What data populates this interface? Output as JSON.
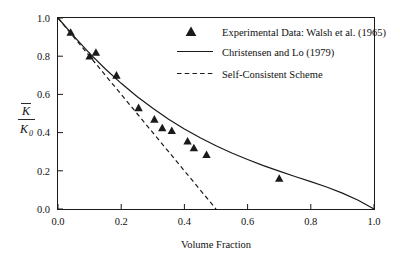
{
  "chart_data": {
    "type": "scatter",
    "title": "",
    "xlabel": "Volume Fraction",
    "ylabel_numerator": "K",
    "ylabel_denominator": "K",
    "ylabel_denominator_subscript": "0",
    "ylabel_has_overbar": true,
    "xlim": [
      0.0,
      1.0
    ],
    "ylim": [
      0.0,
      1.0
    ],
    "grid": false,
    "legend_position": "top-right",
    "x_ticks": [
      "0.0",
      "0.2",
      "0.4",
      "0.6",
      "0.8",
      "1.0"
    ],
    "x_tick_values": [
      0.0,
      0.2,
      0.4,
      0.6,
      0.8,
      1.0
    ],
    "y_ticks": [
      "0.0",
      "0.2",
      "0.4",
      "0.6",
      "0.8",
      "1.0"
    ],
    "y_tick_values": [
      0.0,
      0.2,
      0.4,
      0.6,
      0.8,
      1.0
    ],
    "series": [
      {
        "name": "Experimental Data: Walsh et al. (1965)",
        "type": "scatter",
        "marker": "triangle-up",
        "color": "#1a1a1a",
        "points": [
          [
            0.04,
            0.925
          ],
          [
            0.1,
            0.8
          ],
          [
            0.12,
            0.82
          ],
          [
            0.185,
            0.7
          ],
          [
            0.255,
            0.53
          ],
          [
            0.305,
            0.47
          ],
          [
            0.33,
            0.425
          ],
          [
            0.36,
            0.41
          ],
          [
            0.41,
            0.355
          ],
          [
            0.43,
            0.32
          ],
          [
            0.47,
            0.285
          ],
          [
            0.7,
            0.16
          ]
        ]
      },
      {
        "name": "Christensen and Lo (1979)",
        "type": "line",
        "style": "solid",
        "color": "#1a1a1a",
        "points": [
          [
            0.0,
            1.0
          ],
          [
            0.05,
            0.905
          ],
          [
            0.1,
            0.815
          ],
          [
            0.15,
            0.733
          ],
          [
            0.2,
            0.658
          ],
          [
            0.25,
            0.589
          ],
          [
            0.3,
            0.527
          ],
          [
            0.35,
            0.47
          ],
          [
            0.4,
            0.419
          ],
          [
            0.45,
            0.373
          ],
          [
            0.5,
            0.331
          ],
          [
            0.55,
            0.293
          ],
          [
            0.6,
            0.259
          ],
          [
            0.65,
            0.227
          ],
          [
            0.7,
            0.198
          ],
          [
            0.75,
            0.17
          ],
          [
            0.8,
            0.143
          ],
          [
            0.85,
            0.115
          ],
          [
            0.9,
            0.083
          ],
          [
            0.95,
            0.046
          ],
          [
            1.0,
            0.0
          ]
        ]
      },
      {
        "name": "Self-Consistent Scheme",
        "type": "line",
        "style": "dashed",
        "color": "#1a1a1a",
        "points": [
          [
            0.0,
            1.0
          ],
          [
            0.05,
            0.9
          ],
          [
            0.1,
            0.8
          ],
          [
            0.15,
            0.7
          ],
          [
            0.2,
            0.6
          ],
          [
            0.25,
            0.5
          ],
          [
            0.3,
            0.4
          ],
          [
            0.35,
            0.3
          ],
          [
            0.4,
            0.2
          ],
          [
            0.45,
            0.1
          ],
          [
            0.5,
            0.0
          ]
        ]
      }
    ],
    "legend_entries": [
      {
        "label": "Experimental Data: Walsh et al. (1965)",
        "marker": "triangle-up"
      },
      {
        "label": "Christensen and Lo (1979)",
        "marker": "solid-line"
      },
      {
        "label": "Self-Consistent Scheme",
        "marker": "dashed-line"
      }
    ]
  }
}
